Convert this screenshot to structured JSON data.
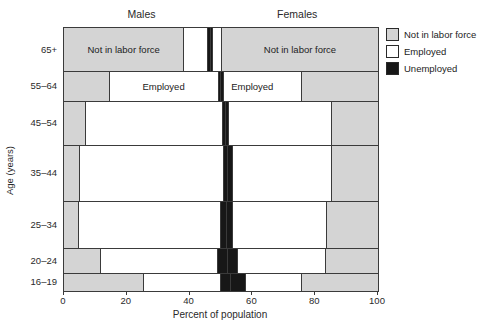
{
  "colors": {
    "not_in_labor_force": "#d4d4d4",
    "employed": "#ffffff",
    "unemployed": "#171717",
    "border": "#3a3a3a",
    "text": "#1c1c1c",
    "background": "#ffffff"
  },
  "legend": {
    "items": [
      {
        "id": "not_in_labor_force",
        "label": "Not in labor force",
        "color": "#d4d4d4"
      },
      {
        "id": "employed",
        "label": "Employed",
        "color": "#ffffff"
      },
      {
        "id": "unemployed",
        "label": "Unemployed",
        "color": "#171717"
      }
    ]
  },
  "chart_data": {
    "type": "bar",
    "subtype": "bidirectional stacked 100% horizontal bars: labor force status by age and sex; male segments stack left-to-center, female segments center-to-right; bar thickness proportional to age-group population share",
    "title": "",
    "xlabel": "Percent of population",
    "ylabel": "Age (years)",
    "xlim": [
      0,
      100
    ],
    "x_ticks": [
      0,
      20,
      40,
      60,
      80,
      100
    ],
    "grid": false,
    "legend_position": "top-right",
    "column_headers": [
      "Males",
      "Females"
    ],
    "legend_entries": [
      "Not in labor force",
      "Employed",
      "Unemployed"
    ],
    "categories": [
      "65+",
      "55–64",
      "45–54",
      "35–44",
      "25–34",
      "20–24",
      "16–19"
    ],
    "row_heights_px": [
      43,
      30,
      44,
      56,
      47,
      25,
      18
    ],
    "segment_order": [
      "male not in labor force",
      "male employed",
      "male unemployed",
      "female unemployed",
      "female employed",
      "female not in labor force"
    ],
    "rows": [
      {
        "age": "65+",
        "height": 43,
        "segments": [
          {
            "sex": "male",
            "type": "not_in_labor_force",
            "value": 38.0,
            "label": "Not in labor force"
          },
          {
            "sex": "male",
            "type": "employed",
            "value": 7.4
          },
          {
            "sex": "male",
            "type": "unemployed",
            "value": 1.0
          },
          {
            "sex": "female",
            "type": "unemployed",
            "value": 0.9
          },
          {
            "sex": "female",
            "type": "employed",
            "value": 2.7
          },
          {
            "sex": "female",
            "type": "not_in_labor_force",
            "value": 50.0,
            "label": "Not in labor force"
          }
        ]
      },
      {
        "age": "55–64",
        "height": 30,
        "segments": [
          {
            "sex": "male",
            "type": "not_in_labor_force",
            "value": 14.2
          },
          {
            "sex": "male",
            "type": "employed",
            "value": 34.7,
            "label": "Employed"
          },
          {
            "sex": "male",
            "type": "unemployed",
            "value": 0.9
          },
          {
            "sex": "female",
            "type": "unemployed",
            "value": 0.9
          },
          {
            "sex": "female",
            "type": "employed",
            "value": 24.8,
            "label": "Employed",
            "align": "left"
          },
          {
            "sex": "female",
            "type": "not_in_labor_force",
            "value": 24.5
          }
        ]
      },
      {
        "age": "45–54",
        "height": 44,
        "segments": [
          {
            "sex": "male",
            "type": "not_in_labor_force",
            "value": 6.6
          },
          {
            "sex": "male",
            "type": "employed",
            "value": 43.6
          },
          {
            "sex": "male",
            "type": "unemployed",
            "value": 1.0
          },
          {
            "sex": "female",
            "type": "unemployed",
            "value": 0.9
          },
          {
            "sex": "female",
            "type": "employed",
            "value": 32.9
          },
          {
            "sex": "female",
            "type": "not_in_labor_force",
            "value": 15.0
          }
        ]
      },
      {
        "age": "35–44",
        "height": 56,
        "segments": [
          {
            "sex": "male",
            "type": "not_in_labor_force",
            "value": 4.8
          },
          {
            "sex": "male",
            "type": "employed",
            "value": 45.9
          },
          {
            "sex": "male",
            "type": "unemployed",
            "value": 1.3
          },
          {
            "sex": "female",
            "type": "unemployed",
            "value": 1.4
          },
          {
            "sex": "female",
            "type": "employed",
            "value": 31.6
          },
          {
            "sex": "female",
            "type": "not_in_labor_force",
            "value": 15.0
          }
        ]
      },
      {
        "age": "25–34",
        "height": 47,
        "segments": [
          {
            "sex": "male",
            "type": "not_in_labor_force",
            "value": 4.5
          },
          {
            "sex": "male",
            "type": "employed",
            "value": 45.3
          },
          {
            "sex": "male",
            "type": "unemployed",
            "value": 1.8
          },
          {
            "sex": "female",
            "type": "unemployed",
            "value": 1.8
          },
          {
            "sex": "female",
            "type": "employed",
            "value": 30.1
          },
          {
            "sex": "female",
            "type": "not_in_labor_force",
            "value": 16.5
          }
        ]
      },
      {
        "age": "20–24",
        "height": 25,
        "segments": [
          {
            "sex": "male",
            "type": "not_in_labor_force",
            "value": 11.5
          },
          {
            "sex": "male",
            "type": "employed",
            "value": 37.2
          },
          {
            "sex": "male",
            "type": "unemployed",
            "value": 3.1
          },
          {
            "sex": "female",
            "type": "unemployed",
            "value": 3.3
          },
          {
            "sex": "female",
            "type": "employed",
            "value": 27.9
          },
          {
            "sex": "female",
            "type": "not_in_labor_force",
            "value": 17.0
          }
        ]
      },
      {
        "age": "16–19",
        "height": 18,
        "segments": [
          {
            "sex": "male",
            "type": "not_in_labor_force",
            "value": 25.0
          },
          {
            "sex": "male",
            "type": "employed",
            "value": 24.8
          },
          {
            "sex": "male",
            "type": "unemployed",
            "value": 3.2
          },
          {
            "sex": "female",
            "type": "unemployed",
            "value": 4.8
          },
          {
            "sex": "female",
            "type": "employed",
            "value": 17.7
          },
          {
            "sex": "female",
            "type": "not_in_labor_force",
            "value": 24.5
          }
        ]
      }
    ]
  }
}
